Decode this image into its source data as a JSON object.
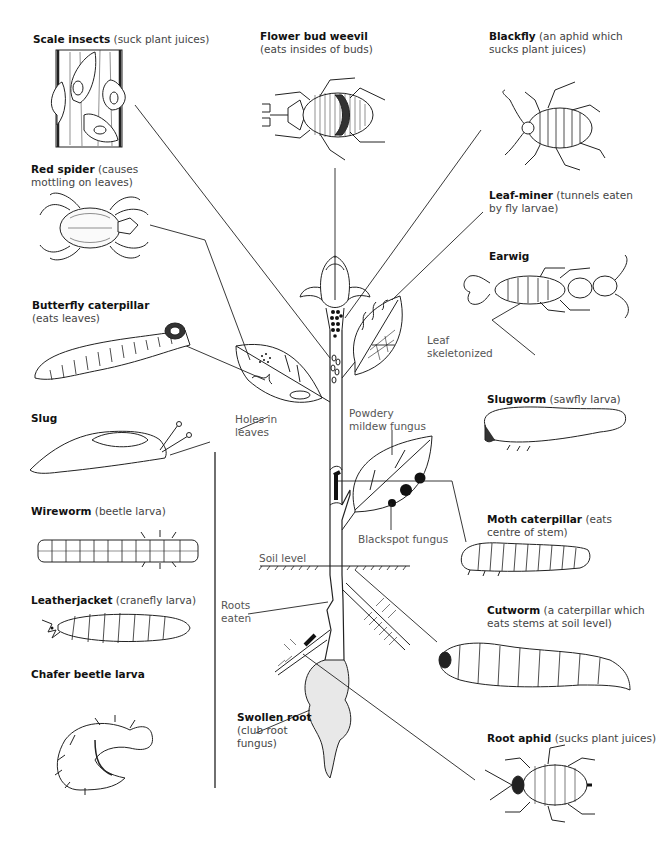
{
  "diagram": {
    "pests": [
      {
        "id": "scale-insects",
        "name": "Scale insects",
        "note": "(suck plant juices)"
      },
      {
        "id": "flower-bud-weevil",
        "name": "Flower bud weevil",
        "note": "(eats insides of buds)"
      },
      {
        "id": "blackfly",
        "name": "Blackfly",
        "note": "(an aphid which",
        "note2": "sucks plant juices)"
      },
      {
        "id": "red-spider",
        "name": "Red spider",
        "note": "(causes",
        "note2": "mottling on leaves)"
      },
      {
        "id": "leaf-miner",
        "name": "Leaf-miner",
        "note": "(tunnels eaten",
        "note2": "by fly larvae)"
      },
      {
        "id": "earwig",
        "name": "Earwig",
        "note": ""
      },
      {
        "id": "butterfly-caterpillar",
        "name": "Butterfly caterpillar",
        "note": "(eats leaves)"
      },
      {
        "id": "slugworm",
        "name": "Slugworm",
        "note": "(sawfly larva)"
      },
      {
        "id": "slug",
        "name": "Slug",
        "note": ""
      },
      {
        "id": "wireworm",
        "name": "Wireworm",
        "note": "(beetle larva)"
      },
      {
        "id": "moth-caterpillar",
        "name": "Moth caterpillar",
        "note": "(eats",
        "note2": "centre of stem)"
      },
      {
        "id": "leatherjacket",
        "name": "Leatherjacket",
        "note": "(cranefly larva)"
      },
      {
        "id": "cutworm",
        "name": "Cutworm",
        "note": "(a caterpillar which",
        "note2": "eats stems at soil level)"
      },
      {
        "id": "chafer-beetle-larva",
        "name": "Chafer beetle larva",
        "note": ""
      },
      {
        "id": "swollen-root",
        "name": "Swollen root",
        "note": "(club root",
        "note2": "fungus)"
      },
      {
        "id": "root-aphid",
        "name": "Root aphid",
        "note": "(sucks plant juices)"
      }
    ],
    "damage_labels": {
      "leaf_skeletonized_1": "Leaf",
      "leaf_skeletonized_2": "skeletonized",
      "holes_1": "Holes in",
      "holes_2": "leaves",
      "powdery_1": "Powdery",
      "powdery_2": "mildew fungus",
      "blackspot": "Blackspot fungus",
      "soil_level": "Soil level",
      "roots_eaten_1": "Roots",
      "roots_eaten_2": "eaten"
    }
  }
}
